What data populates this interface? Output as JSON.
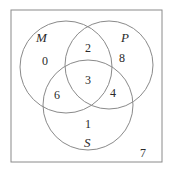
{
  "diagram": {
    "type": "venn-3",
    "universe": {
      "outside_count": "7"
    },
    "sets": [
      {
        "name": "M",
        "label": "M"
      },
      {
        "name": "P",
        "label": "P"
      },
      {
        "name": "S",
        "label": "S"
      }
    ],
    "regions": {
      "M_only": "0",
      "P_only": "8",
      "S_only": "1",
      "M_and_P_only": "2",
      "M_and_S_only": "6",
      "P_and_S_only": "4",
      "M_P_S": "3",
      "none": "7"
    },
    "colors": {
      "line": "#8a8a8a",
      "text": "#2a2a2a",
      "background": "#ffffff"
    }
  }
}
